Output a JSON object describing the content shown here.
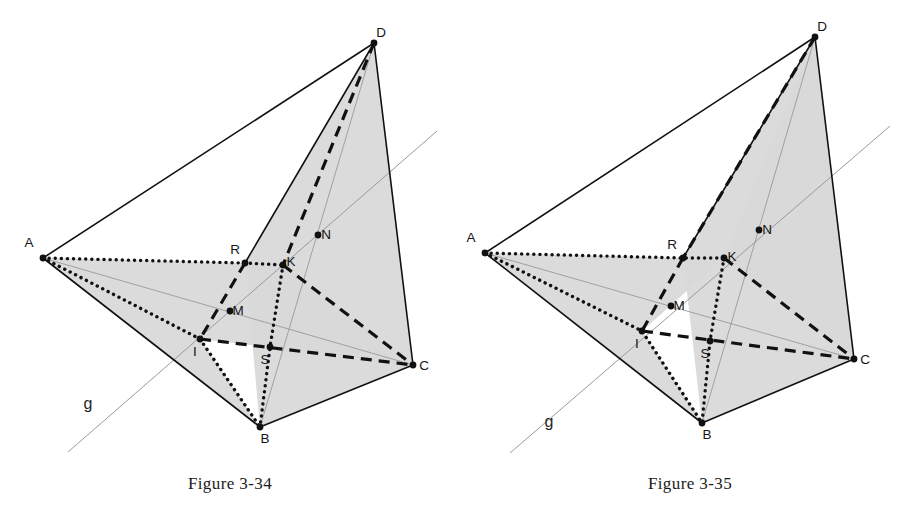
{
  "page": {
    "width": 920,
    "height": 523,
    "background": "#ffffff",
    "ink": "#111111",
    "shade_fill": "#d9d9d9",
    "thin_line": "#9a9a9a"
  },
  "figures": [
    {
      "id": "figure-3-34",
      "caption": "Figure 3-34",
      "line_label": "g",
      "line_label_pos": {
        "x": 88,
        "y": 409
      },
      "guide_line": {
        "x1": 68,
        "y1": 452,
        "x2": 437,
        "y2": 131
      },
      "vertices": [
        {
          "name": "A",
          "x": 43,
          "y": 258,
          "label_dx": -14,
          "label_dy": -11,
          "dot": true
        },
        {
          "name": "B",
          "x": 260,
          "y": 427,
          "label_dx": 5,
          "label_dy": 16,
          "dot": true
        },
        {
          "name": "C",
          "x": 413,
          "y": 365,
          "label_dx": 11,
          "label_dy": 5,
          "dot": true
        },
        {
          "name": "D",
          "x": 374,
          "y": 43,
          "label_dx": 7,
          "label_dy": -6,
          "dot": true
        },
        {
          "name": "R",
          "x": 245,
          "y": 263,
          "label_dx": -10,
          "label_dy": -9,
          "dot": true
        },
        {
          "name": "K",
          "x": 283,
          "y": 265,
          "label_dx": 8,
          "label_dy": 1,
          "dot": true
        },
        {
          "name": "N",
          "x": 318,
          "y": 235,
          "label_dx": 8,
          "label_dy": 4,
          "dot": true
        },
        {
          "name": "M",
          "x": 230,
          "y": 311,
          "label_dx": 8,
          "label_dy": 4,
          "dot": true
        },
        {
          "name": "I",
          "x": 200,
          "y": 339,
          "label_dx": -5,
          "label_dy": 17,
          "dot": true
        },
        {
          "name": "S",
          "x": 270,
          "y": 347,
          "label_dx": -5,
          "label_dy": 17,
          "dot": true
        }
      ],
      "shaded_faces": [
        {
          "name": "face-a-i-b-wedge",
          "points": "43,258 200,339 260,427"
        },
        {
          "name": "face-a-r-k-i",
          "points": "43,258 245,263 283,265 200,339"
        },
        {
          "name": "face-i-k-c",
          "points": "200,339 283,265 413,365"
        },
        {
          "name": "face-b-c-d",
          "points": "260,427 413,365 374,43 245,263"
        }
      ],
      "solid_edges": [
        {
          "name": "edge-a-d",
          "x1": 43,
          "y1": 258,
          "x2": 374,
          "y2": 43
        },
        {
          "name": "edge-a-b",
          "x1": 43,
          "y1": 258,
          "x2": 260,
          "y2": 427
        },
        {
          "name": "edge-b-c",
          "x1": 260,
          "y1": 427,
          "x2": 413,
          "y2": 365
        },
        {
          "name": "edge-d-c",
          "x1": 374,
          "y1": 43,
          "x2": 413,
          "y2": 365
        },
        {
          "name": "edge-b-d-upper",
          "x1": 245,
          "y1": 263,
          "x2": 374,
          "y2": 43
        }
      ],
      "thin_edges": [
        {
          "name": "thin-a-c",
          "x1": 43,
          "y1": 258,
          "x2": 413,
          "y2": 365
        },
        {
          "name": "thin-d-b",
          "x1": 374,
          "y1": 43,
          "x2": 260,
          "y2": 427
        }
      ],
      "dashed_edges": [
        {
          "name": "dash-d-k",
          "x1": 374,
          "y1": 43,
          "x2": 283,
          "y2": 265
        },
        {
          "name": "dash-k-c",
          "x1": 283,
          "y1": 265,
          "x2": 413,
          "y2": 365
        },
        {
          "name": "dash-i-c",
          "x1": 200,
          "y1": 339,
          "x2": 413,
          "y2": 365
        },
        {
          "name": "dash-b-d-lower",
          "x1": 245,
          "y1": 263,
          "x2": 200,
          "y2": 339
        }
      ],
      "dotted_paths": [
        {
          "name": "dot-a-r-k",
          "points": "43,258 245,263 283,265"
        },
        {
          "name": "dot-k-s-b",
          "points": "283,265 270,347 260,427"
        },
        {
          "name": "dot-a-i-b",
          "points": "43,258 200,339 260,427"
        }
      ]
    },
    {
      "id": "figure-3-35",
      "caption": "Figure 3-35",
      "line_label": "g",
      "line_label_pos": {
        "x": 549,
        "y": 427
      },
      "guide_line": {
        "x1": 510,
        "y1": 453,
        "x2": 890,
        "y2": 126
      },
      "vertices": [
        {
          "name": "A",
          "x": 485,
          "y": 253,
          "label_dx": -14,
          "label_dy": -11,
          "dot": true
        },
        {
          "name": "B",
          "x": 702,
          "y": 423,
          "label_dx": 5,
          "label_dy": 16,
          "dot": true
        },
        {
          "name": "C",
          "x": 854,
          "y": 359,
          "label_dx": 11,
          "label_dy": 5,
          "dot": true
        },
        {
          "name": "D",
          "x": 815,
          "y": 37,
          "label_dx": 7,
          "label_dy": -6,
          "dot": true
        },
        {
          "name": "R",
          "x": 683,
          "y": 258,
          "label_dx": -11,
          "label_dy": -9,
          "dot": true
        },
        {
          "name": "K",
          "x": 724,
          "y": 258,
          "label_dx": 8,
          "label_dy": 3,
          "dot": true
        },
        {
          "name": "N",
          "x": 759,
          "y": 230,
          "label_dx": 8,
          "label_dy": 4,
          "dot": true
        },
        {
          "name": "M",
          "x": 671,
          "y": 306,
          "label_dx": 8,
          "label_dy": 4,
          "dot": true
        },
        {
          "name": "I",
          "x": 642,
          "y": 331,
          "label_dx": -5,
          "label_dy": 17,
          "dot": true
        },
        {
          "name": "S",
          "x": 710,
          "y": 341,
          "label_dx": -5,
          "label_dy": 17,
          "dot": true
        }
      ],
      "shaded_faces": [
        {
          "name": "face-a-i-b-wedge",
          "points": "485,253 642,331 702,423"
        },
        {
          "name": "face-a-r-k-i",
          "points": "485,253 683,258 724,258 642,331"
        },
        {
          "name": "face-b-c-d",
          "points": "702,423 854,359 815,37 683,258"
        },
        {
          "name": "face-k-c-d",
          "points": "724,258 854,359 815,37"
        }
      ],
      "solid_edges": [
        {
          "name": "edge-a-d",
          "x1": 485,
          "y1": 253,
          "x2": 815,
          "y2": 37
        },
        {
          "name": "edge-a-b",
          "x1": 485,
          "y1": 253,
          "x2": 702,
          "y2": 423
        },
        {
          "name": "edge-b-c",
          "x1": 702,
          "y1": 423,
          "x2": 854,
          "y2": 359
        },
        {
          "name": "edge-d-c",
          "x1": 815,
          "y1": 37,
          "x2": 854,
          "y2": 359
        },
        {
          "name": "edge-b-d-upper",
          "x1": 683,
          "y1": 258,
          "x2": 815,
          "y2": 37
        }
      ],
      "thin_edges": [
        {
          "name": "thin-a-c",
          "x1": 485,
          "y1": 253,
          "x2": 854,
          "y2": 359
        },
        {
          "name": "thin-d-b",
          "x1": 815,
          "y1": 37,
          "x2": 702,
          "y2": 423
        }
      ],
      "dashed_edges": [
        {
          "name": "dash-d-r",
          "x1": 815,
          "y1": 37,
          "x2": 683,
          "y2": 258
        },
        {
          "name": "dash-r-i",
          "x1": 683,
          "y1": 258,
          "x2": 642,
          "y2": 331
        },
        {
          "name": "dash-k-c",
          "x1": 724,
          "y1": 258,
          "x2": 854,
          "y2": 359
        },
        {
          "name": "dash-i-c",
          "x1": 642,
          "y1": 331,
          "x2": 854,
          "y2": 359
        }
      ],
      "dotted_paths": [
        {
          "name": "dot-a-r-k",
          "points": "485,253 683,258 724,258"
        },
        {
          "name": "dot-k-s-b",
          "points": "724,258 710,341 702,423"
        },
        {
          "name": "dot-a-i-b",
          "points": "485,253 642,331 702,423"
        }
      ]
    }
  ]
}
